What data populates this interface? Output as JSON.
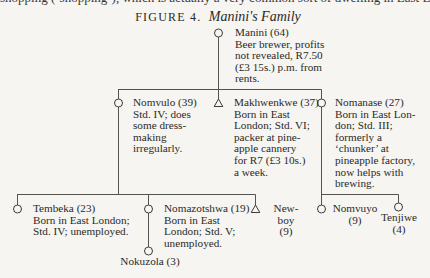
{
  "figure": {
    "label": "FIGURE 4.",
    "title": "Manini's Family"
  },
  "cutoff_text": "shopping (‘shopping’), which is actually a very common sort of dwelling in East London. Many",
  "people": {
    "manini": {
      "name": "Manini (64)",
      "sex": "female",
      "lines": [
        "Beer brewer, profits",
        "not revealed, R7.50",
        "(£3 15s.) p.m. from",
        "rents."
      ]
    },
    "nomvulo": {
      "name": "Nomvulo (39)",
      "sex": "female",
      "lines": [
        "Std. IV; does",
        "some dress-",
        "making",
        "irregularly."
      ]
    },
    "makhwenkwe": {
      "name": "Makhwenkwe (37)",
      "sex": "male",
      "lines": [
        "Born in East",
        "London; Std. VI;",
        "packer at pine-",
        "apple cannery",
        "for R7 (£3 10s.)",
        "a week."
      ]
    },
    "nomanase": {
      "name": "Nomanase (27)",
      "sex": "female",
      "lines": [
        "Born in East Lon-",
        "don; Std. III;",
        "formerly a",
        "‘chunker’ at",
        "pineapple factory,",
        "now helps with",
        "brewing."
      ]
    },
    "tembeka": {
      "name": "Tembeka (23)",
      "sex": "female",
      "lines": [
        "Born in East London;",
        "Std. IV; unemployed."
      ]
    },
    "nomazotshwa": {
      "name": "Nomazotshwa (19)",
      "sex": "female",
      "lines": [
        "Born in East",
        "London; Std. V;",
        "unemployed."
      ]
    },
    "newboy": {
      "name": "New-boy",
      "age": "(9)",
      "sex": "male"
    },
    "nomvuyo": {
      "name": "Nomvuyo",
      "age": "(9)",
      "sex": "female"
    },
    "tenjiwe": {
      "name": "Tenjiwe",
      "age": "(4)",
      "sex": "female"
    },
    "nokuzola": {
      "name": "Nokuzola (3)",
      "sex": "female"
    }
  },
  "symbols": {
    "female": "circle",
    "male": "triangle"
  },
  "colors": {
    "background": "#f6f5f1",
    "ink": "#2b2a28",
    "line": "#555350"
  }
}
